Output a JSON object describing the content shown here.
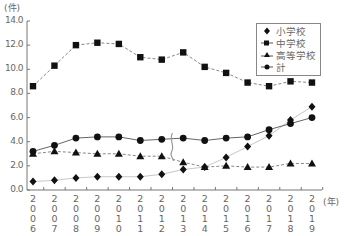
{
  "chart_data": {
    "type": "line",
    "title": "",
    "xlabel": "(年)",
    "ylabel": "(件)",
    "ylim": [
      0,
      14
    ],
    "yticks": [
      "0.0",
      "2.0",
      "4.0",
      "6.0",
      "8.0",
      "10.0",
      "12.0",
      "14.0"
    ],
    "categories": [
      "2006",
      "2007",
      "2008",
      "2009",
      "2010",
      "2011",
      "2012",
      "2013",
      "2014",
      "2015",
      "2016",
      "2017",
      "2018",
      "2019"
    ],
    "grid": false,
    "legend_position": "upper right",
    "break_marker_between": [
      "2012",
      "2013"
    ],
    "series": [
      {
        "name": "小学校",
        "marker": "diamond",
        "line": "solid-light",
        "values": [
          0.7,
          0.8,
          1.0,
          1.1,
          1.1,
          1.1,
          1.3,
          1.7,
          1.9,
          2.7,
          3.6,
          4.5,
          5.8,
          6.9
        ]
      },
      {
        "name": "中学校",
        "marker": "square",
        "line": "dashed",
        "values": [
          8.6,
          10.3,
          12.0,
          12.2,
          12.1,
          11.0,
          10.8,
          11.4,
          10.2,
          9.7,
          8.9,
          8.6,
          9.0,
          8.9
        ]
      },
      {
        "name": "高等学校",
        "marker": "triangle",
        "line": "dashed",
        "values": [
          3.0,
          3.2,
          3.1,
          3.0,
          3.0,
          2.8,
          2.8,
          2.3,
          1.9,
          2.0,
          1.9,
          1.9,
          2.2,
          2.2
        ]
      },
      {
        "name": "計",
        "marker": "circle",
        "line": "solid",
        "values": [
          3.2,
          3.7,
          4.3,
          4.4,
          4.4,
          4.1,
          4.2,
          4.3,
          4.1,
          4.3,
          4.4,
          5.0,
          5.5,
          6.0
        ]
      }
    ]
  },
  "axis": {
    "y_unit": "(件)",
    "x_unit": "(年)"
  },
  "legend": {
    "items": [
      "小学校",
      "中学校",
      "高等学校",
      "計"
    ]
  }
}
